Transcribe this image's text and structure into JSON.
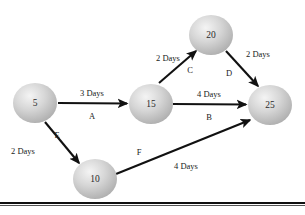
{
  "diagram": {
    "kind": "project-network-diagram",
    "background_color": "#ffffff",
    "line_color": "#111111",
    "node_fill_light": "#f2f2f2",
    "node_fill_mid": "#c9c9c9",
    "node_fill_dark": "#a9a9a9",
    "node_stroke_color": "#3a3a3a",
    "nodes": [
      {
        "id": "n5",
        "label": "5",
        "cx": 35,
        "cy": 103,
        "rx": 22,
        "ry": 20
      },
      {
        "id": "n15",
        "label": "15",
        "cx": 151,
        "cy": 104,
        "rx": 22,
        "ry": 20
      },
      {
        "id": "n20",
        "label": "20",
        "cx": 211,
        "cy": 35,
        "rx": 22,
        "ry": 20
      },
      {
        "id": "n25",
        "label": "25",
        "cx": 270,
        "cy": 105,
        "rx": 22,
        "ry": 20
      },
      {
        "id": "n10",
        "label": "10",
        "cx": 95,
        "cy": 179,
        "rx": 22,
        "ry": 20
      }
    ],
    "edges": [
      {
        "id": "edgeA",
        "name": "A",
        "duration": "3 Days",
        "from": "n5",
        "to": "n15",
        "x1": 58,
        "y1": 103,
        "x2": 127,
        "y2": 103.5,
        "duration_x": 92,
        "duration_y": 94,
        "name_x": 92,
        "name_y": 117
      },
      {
        "id": "edgeB",
        "name": "B",
        "duration": "4 Days",
        "from": "n15",
        "to": "n25",
        "x1": 173,
        "y1": 104,
        "x2": 246,
        "y2": 104.5,
        "duration_x": 209,
        "duration_y": 95,
        "name_x": 209,
        "name_y": 118
      },
      {
        "id": "edgeC",
        "name": "C",
        "duration": "2 Days",
        "from": "n15",
        "to": "n20",
        "x1": 159,
        "y1": 83,
        "x2": 196,
        "y2": 51,
        "duration_x": 168,
        "duration_y": 59,
        "name_x": 190,
        "name_y": 71
      },
      {
        "id": "edgeD",
        "name": "D",
        "duration": "2 Days",
        "from": "n20",
        "to": "n25",
        "x1": 226,
        "y1": 51,
        "x2": 258,
        "y2": 86,
        "duration_x": 258,
        "duration_y": 55,
        "name_x": 229,
        "name_y": 74
      },
      {
        "id": "edgeE",
        "name": "E",
        "duration": "2 Days",
        "from": "n5",
        "to": "n10",
        "x1": 45,
        "y1": 122,
        "x2": 79,
        "y2": 163,
        "duration_x": 23,
        "duration_y": 152,
        "name_x": 57,
        "name_y": 136
      },
      {
        "id": "edgeF",
        "name": "F",
        "duration": "4 Days",
        "from": "n10",
        "to": "n25",
        "x1": 116,
        "y1": 174,
        "x2": 250,
        "y2": 120,
        "duration_x": 186,
        "duration_y": 167,
        "name_x": 139,
        "name_y": 153
      }
    ],
    "footer": {
      "thick_rule_y": 202,
      "thick_rule_height": 2,
      "thin_rule_y": 205,
      "thin_rule_height": 1
    }
  }
}
